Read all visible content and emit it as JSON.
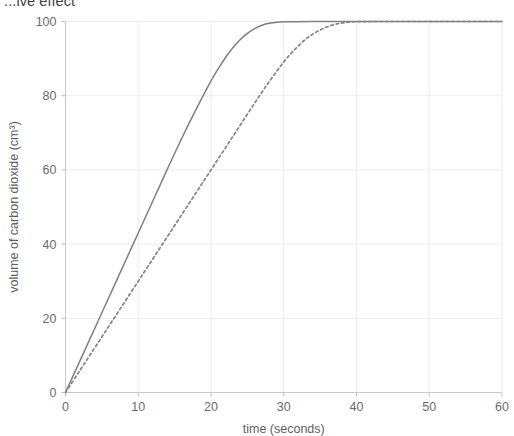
{
  "title": "...ive effect",
  "chart_data": {
    "type": "line",
    "title": "...ive effect",
    "xlabel": "time (seconds)",
    "ylabel": "volume of carbon dioxide (cm³)",
    "xlim": [
      0,
      60
    ],
    "ylim": [
      0,
      100
    ],
    "xticks": [
      0,
      10,
      20,
      30,
      40,
      50,
      60
    ],
    "yticks": [
      0,
      20,
      40,
      60,
      80,
      100
    ],
    "xtick_labels": [
      "0",
      "10",
      "20",
      "30",
      "40",
      "50",
      "60"
    ],
    "ytick_labels": [
      "0",
      "20",
      "40",
      "60",
      "80",
      "100"
    ],
    "grid": true,
    "legend": null,
    "colors": {
      "solid_curve": "#7f7f86",
      "dashed_curve": "#83838a",
      "gridline": "#ededf0",
      "axis": "#c9c9cc",
      "text": "#5f5f5f",
      "background": "#ffffff"
    },
    "series": [
      {
        "name": "solid curve",
        "style": "solid",
        "x": [
          0,
          2,
          4,
          6,
          8,
          10,
          12,
          14,
          16,
          18,
          20,
          21,
          22,
          23,
          24,
          25,
          26,
          27,
          28,
          30,
          35,
          40,
          45,
          50,
          55,
          60
        ],
        "values": [
          0,
          8.6,
          17.2,
          25.8,
          34.4,
          43,
          51.6,
          60.2,
          68.6,
          76.5,
          84,
          87.3,
          90.3,
          92.9,
          95.1,
          96.8,
          98.1,
          99.0,
          99.5,
          99.9,
          100,
          100,
          100,
          100,
          100,
          100
        ]
      },
      {
        "name": "dashed curve",
        "style": "dashed",
        "x": [
          0,
          2,
          4,
          6,
          8,
          10,
          12,
          14,
          16,
          18,
          20,
          22,
          24,
          26,
          28,
          30,
          31,
          32,
          33,
          34,
          35,
          36,
          37,
          38,
          40,
          45,
          50,
          55,
          60
        ],
        "values": [
          0,
          6.0,
          12.0,
          18.0,
          24.0,
          30.0,
          36.0,
          42.0,
          48.0,
          54.0,
          60.0,
          66.0,
          72.0,
          78.0,
          83.8,
          89.1,
          91.4,
          93.4,
          95.2,
          96.6,
          97.7,
          98.6,
          99.2,
          99.6,
          99.95,
          100,
          100,
          100,
          100
        ]
      }
    ]
  }
}
